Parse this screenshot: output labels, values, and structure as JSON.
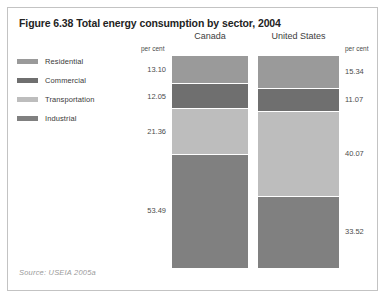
{
  "figure": {
    "title": "Figure 6.38 Total energy consumption by sector, 2004",
    "source": "Source: USEIA 2005a",
    "unit_label_left": "per cent",
    "unit_label_right": "per cent"
  },
  "legend": {
    "items": [
      {
        "label": "Residential",
        "color": "#9a9a9a"
      },
      {
        "label": "Commercial",
        "color": "#6f6f6f"
      },
      {
        "label": "Transportation",
        "color": "#bdbdbd"
      },
      {
        "label": "Industrial",
        "color": "#808080"
      }
    ]
  },
  "chart_data": {
    "type": "bar",
    "title": "Figure 6.38 Total energy consumption by sector, 2004",
    "subtitle": "",
    "xlabel": "",
    "ylabel": "per cent",
    "ylim": [
      0,
      100
    ],
    "grid": false,
    "legend_position": "left",
    "stacked": true,
    "orientation": "vertical",
    "categories": [
      "Canada",
      "United States"
    ],
    "series": [
      {
        "name": "Residential",
        "color": "#9a9a9a",
        "values": [
          13.1,
          15.34
        ]
      },
      {
        "name": "Commercial",
        "color": "#6f6f6f",
        "values": [
          12.05,
          11.07
        ]
      },
      {
        "name": "Transportation",
        "color": "#bdbdbd",
        "values": [
          21.36,
          40.07
        ]
      },
      {
        "name": "Industrial",
        "color": "#808080",
        "values": [
          53.49,
          33.52
        ]
      }
    ],
    "columns": [
      {
        "name": "Canada",
        "label_side": "left",
        "segments": [
          {
            "sector": "Residential",
            "value": 13.1,
            "label": "13.10",
            "color": "#9a9a9a"
          },
          {
            "sector": "Commercial",
            "value": 12.05,
            "label": "12.05",
            "color": "#6f6f6f"
          },
          {
            "sector": "Transportation",
            "value": 21.36,
            "label": "21.36",
            "color": "#bdbdbd"
          },
          {
            "sector": "Industrial",
            "value": 53.49,
            "label": "53.49",
            "color": "#808080"
          }
        ]
      },
      {
        "name": "United States",
        "label_side": "right",
        "segments": [
          {
            "sector": "Residential",
            "value": 15.34,
            "label": "15.34",
            "color": "#9a9a9a"
          },
          {
            "sector": "Commercial",
            "value": 11.07,
            "label": "11.07",
            "color": "#6f6f6f"
          },
          {
            "sector": "Transportation",
            "value": 40.07,
            "label": "40.07",
            "color": "#bdbdbd"
          },
          {
            "sector": "Industrial",
            "value": 33.52,
            "label": "33.52",
            "color": "#808080"
          }
        ]
      }
    ],
    "annotations": [
      "per cent",
      "per cent"
    ],
    "source": "Source: USEIA 2005a"
  }
}
